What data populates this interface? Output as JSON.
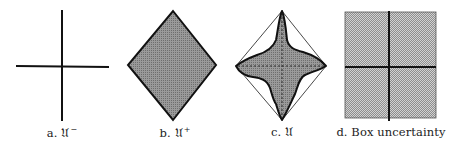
{
  "figure": {
    "panels": [
      {
        "id": "a",
        "prefix": "a.",
        "symbol": "𝔘",
        "superscript": "−",
        "shape": "cross"
      },
      {
        "id": "b",
        "prefix": "b.",
        "symbol": "𝔘",
        "superscript": "+",
        "shape": "filled-diamond"
      },
      {
        "id": "c",
        "prefix": "c.",
        "symbol": "𝔘",
        "superscript": "",
        "shape": "star-inside-dashed-diamond"
      },
      {
        "id": "d",
        "prefix": "d.",
        "symbol": "Box uncertainty",
        "superscript": "",
        "shape": "filled-box-with-cross"
      }
    ],
    "colors": {
      "stroke": "#111111",
      "fill_dense": "#8a8a8a",
      "fill_light": "#b8b8b8",
      "background": "#ffffff"
    }
  }
}
